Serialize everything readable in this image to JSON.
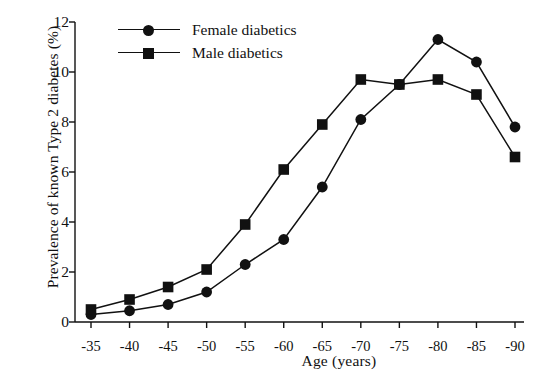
{
  "chart_data": {
    "type": "line",
    "title": "",
    "xlabel": "Age (years)",
    "ylabel": "Prevalence of known Type 2 diabetes (%)",
    "x": [
      "-35",
      "-40",
      "-45",
      "-50",
      "-55",
      "-60",
      "-65",
      "-70",
      "-75",
      "-80",
      "-85",
      "-90"
    ],
    "xticklabels": [
      "-35",
      "-40",
      "-45",
      "-50",
      "-55",
      "-60",
      "-65",
      "-70",
      "-75",
      "-80",
      "-85",
      "-90"
    ],
    "yticklabels": [
      "0",
      "2",
      "4",
      "6",
      "8",
      "10",
      "12"
    ],
    "yticks": [
      0,
      2,
      4,
      6,
      8,
      10,
      12
    ],
    "ylim": [
      0,
      12
    ],
    "grid": false,
    "legend_position": "upper left",
    "series": [
      {
        "name": "Female diabetics",
        "marker": "circle",
        "color": "#111111",
        "values": [
          0.3,
          0.45,
          0.7,
          1.2,
          2.3,
          3.3,
          5.4,
          8.1,
          9.5,
          11.3,
          10.4,
          7.8
        ]
      },
      {
        "name": "Male diabetics",
        "marker": "square",
        "color": "#111111",
        "values": [
          0.5,
          0.9,
          1.4,
          2.1,
          3.9,
          6.1,
          7.9,
          9.7,
          9.5,
          9.7,
          9.1,
          6.6
        ]
      }
    ]
  },
  "legend": {
    "entries": [
      {
        "label": "Female diabetics",
        "marker": "circle"
      },
      {
        "label": "Male diabetics",
        "marker": "square"
      }
    ]
  },
  "footer": {
    "partial_caption": ""
  }
}
